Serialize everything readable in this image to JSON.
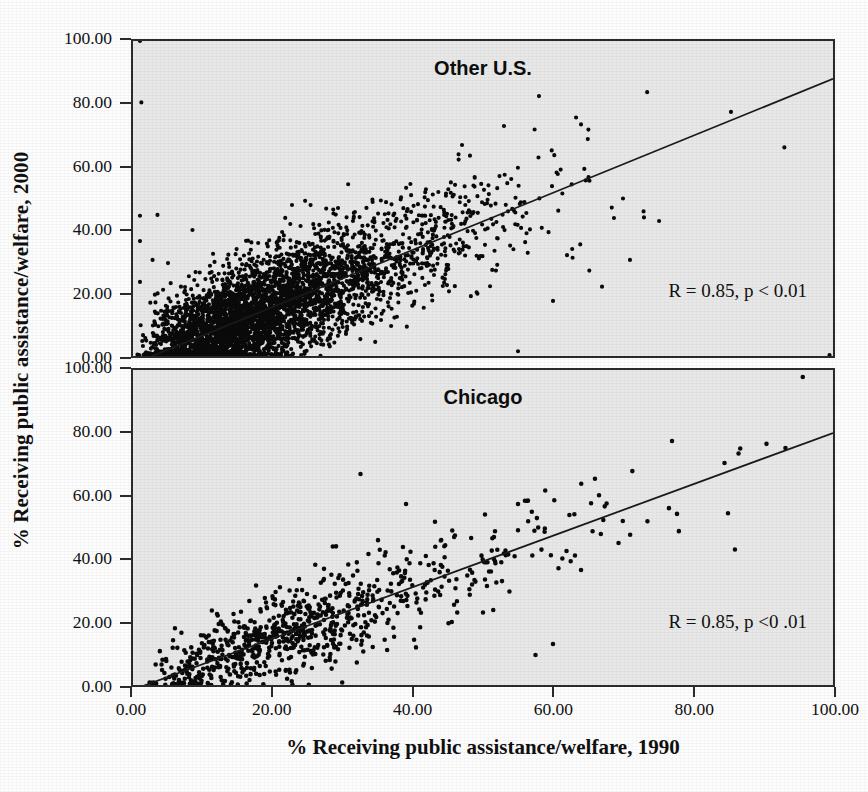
{
  "figure": {
    "xlabel": "% Receiving public assistance/welfare, 1990",
    "ylabel": "% Receiving public assistance/welfare, 2000"
  },
  "axis": {
    "ticks": [
      "0.00",
      "20.00",
      "40.00",
      "60.00",
      "80.00",
      "100.00"
    ],
    "tick_values": [
      0,
      20,
      40,
      60,
      80,
      100
    ]
  },
  "panels": {
    "top": {
      "title": "Other U.S.",
      "annotation": "R = 0.85, p < 0.01"
    },
    "bottom": {
      "title": "Chicago",
      "annotation": "R = 0.85, p <0 .01"
    }
  },
  "colors": {
    "panel_background": "#e8e8e8",
    "page_background": "#fdfdfd",
    "frame": "#2b2b2b",
    "point": "#0a0a0a",
    "fit_line": "#1a1a1a",
    "text": "#101010"
  },
  "chart_data": [
    {
      "type": "scatter",
      "title": "Other U.S.",
      "xlabel": "% Receiving public assistance/welfare, 1990",
      "ylabel": "% Receiving public assistance/welfare, 2000",
      "xlim": [
        0,
        100
      ],
      "ylim": [
        0,
        100
      ],
      "xticks": [
        0,
        20,
        40,
        60,
        80,
        100
      ],
      "yticks": [
        0,
        20,
        40,
        60,
        80,
        100
      ],
      "grid": false,
      "legend": "none",
      "annotation": "R = 0.85, p < 0.01",
      "correlation_r": 0.85,
      "p_value_text": "p < 0.01",
      "n_points_approx": 4200,
      "marker_size_px": 4.2,
      "fit_line": {
        "x": [
          0,
          100
        ],
        "y": [
          -2.5,
          88.0
        ]
      },
      "cluster_model": {
        "note": "Very dense saturated mass of points hugging the lower-left; spread widens with x.",
        "x_distribution": "right-skewed, mode near 3, long tail to 75",
        "trend_slope": 0.905,
        "trend_intercept": -2.5,
        "residual_sd_low_x": 7.5,
        "residual_sd_high_x": 11.0,
        "y_floor": 0
      },
      "notable_points": [
        [
          1.0,
          100.0
        ],
        [
          1.2,
          80.5
        ],
        [
          1.0,
          44.5
        ],
        [
          3.5,
          44.8
        ],
        [
          1.0,
          36.5
        ],
        [
          2.8,
          30.5
        ],
        [
          5.0,
          29.5
        ],
        [
          1.0,
          23.5
        ],
        [
          8.5,
          40.0
        ],
        [
          99.5,
          0.3
        ],
        [
          58.0,
          82.5
        ],
        [
          53.0,
          73.0
        ],
        [
          64.0,
          73.5
        ],
        [
          47.0,
          67.0
        ],
        [
          46.5,
          64.0
        ],
        [
          70.0,
          50.0
        ],
        [
          73.0,
          44.0
        ],
        [
          62.0,
          32.0
        ],
        [
          67.0,
          22.0
        ],
        [
          60.0,
          17.5
        ],
        [
          71.0,
          30.5
        ],
        [
          55.0,
          1.5
        ]
      ]
    },
    {
      "type": "scatter",
      "title": "Chicago",
      "xlabel": "% Receiving public assistance/welfare, 1990",
      "ylabel": "% Receiving public assistance/welfare, 2000",
      "xlim": [
        0,
        100
      ],
      "ylim": [
        0,
        100
      ],
      "xticks": [
        0,
        20,
        40,
        60,
        80,
        100
      ],
      "yticks": [
        0,
        20,
        40,
        60,
        80,
        100
      ],
      "grid": false,
      "legend": "none",
      "annotation": "R = 0.85, p <0 .01",
      "correlation_r": 0.85,
      "p_value_text": "p <0 .01",
      "n_points_approx": 830,
      "marker_size_px": 4.6,
      "fit_line": {
        "x": [
          0,
          100
        ],
        "y": [
          -1.5,
          80.0
        ]
      },
      "cluster_model": {
        "note": "Sparser, individually visible dots along a clear positive linear band.",
        "x_distribution": "right-skewed, mode near 8, tail to 88",
        "trend_slope": 0.815,
        "trend_intercept": -1.5,
        "residual_sd_low_x": 5.0,
        "residual_sd_high_x": 10.5,
        "y_floor": 0
      },
      "notable_points": [
        [
          32.5,
          67.0
        ],
        [
          39.0,
          57.5
        ],
        [
          56.0,
          58.5
        ],
        [
          77.0,
          77.5
        ],
        [
          84.5,
          70.5
        ],
        [
          86.5,
          73.5
        ],
        [
          85.0,
          54.5
        ],
        [
          86.0,
          43.0
        ],
        [
          73.5,
          52.0
        ],
        [
          66.0,
          65.5
        ],
        [
          64.0,
          36.5
        ],
        [
          60.0,
          13.0
        ],
        [
          57.5,
          9.5
        ],
        [
          50.0,
          23.0
        ],
        [
          46.0,
          47.5
        ],
        [
          35.0,
          46.0
        ],
        [
          29.0,
          44.0
        ],
        [
          21.0,
          31.0
        ],
        [
          12.0,
          22.5
        ],
        [
          6.0,
          18.0
        ]
      ]
    }
  ]
}
